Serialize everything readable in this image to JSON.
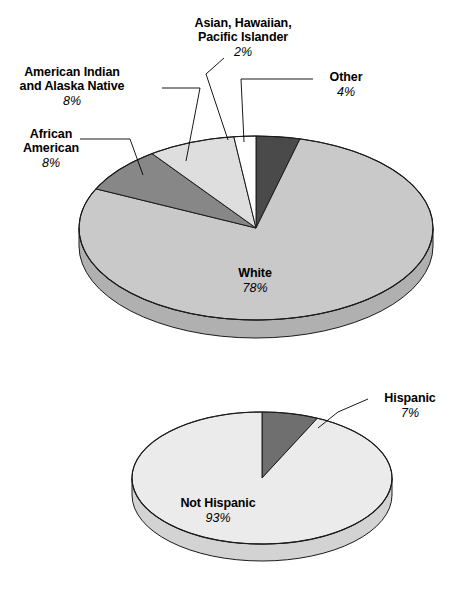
{
  "figure": {
    "background": "#ffffff",
    "width": 458,
    "height": 597
  },
  "chart_data": [
    {
      "type": "pie",
      "title": "",
      "chart_id": "race-pie",
      "three_d": true,
      "legend": "callout-labels",
      "categories": [
        "Other",
        "White",
        "African American",
        "American Indian and Alaska Native",
        "Asian, Hawaiian, Pacific Islander"
      ],
      "values": [
        4,
        78,
        8,
        8,
        2
      ],
      "slices": [
        {
          "label": "Other",
          "pct_text": "4%",
          "value": 4,
          "color": "#4a4a4a",
          "side_color": "#3a3a3a"
        },
        {
          "label": "White",
          "pct_text": "78%",
          "value": 78,
          "color": "#c9c9c9",
          "side_color": "#b0b0b0"
        },
        {
          "label": "African American",
          "pct_text": "8%",
          "value": 8,
          "color": "#878787",
          "side_color": "#6f6f6f"
        },
        {
          "label": "American Indian and Alaska Native",
          "pct_text": "8%",
          "value": 8,
          "color": "#dedede",
          "side_color": "#c2c2c2"
        },
        {
          "label": "Asian, Hawaiian, Pacific Islander",
          "pct_text": "2%",
          "value": 2,
          "color": "#ffffff",
          "side_color": "#e8e8e8"
        }
      ]
    },
    {
      "type": "pie",
      "title": "",
      "chart_id": "ethnicity-pie",
      "three_d": true,
      "legend": "callout-labels",
      "categories": [
        "Hispanic",
        "Not Hispanic"
      ],
      "values": [
        7,
        93
      ],
      "slices": [
        {
          "label": "Hispanic",
          "pct_text": "7%",
          "value": 7,
          "color": "#6f6f6f",
          "side_color": "#5c5c5c"
        },
        {
          "label": "Not Hispanic",
          "pct_text": "93%",
          "value": 93,
          "color": "#ebebeb",
          "side_color": "#d3d3d3"
        }
      ]
    }
  ],
  "labels": {
    "asian": {
      "line1": "Asian, Hawaiian,",
      "line2": "Pacific Islander",
      "pct": "2%"
    },
    "american_indian": {
      "line1": "American Indian",
      "line2": "and Alaska Native",
      "pct": "8%"
    },
    "african_american": {
      "line1": "African",
      "line2": "American",
      "pct": "8%"
    },
    "other": {
      "line1": "Other",
      "pct": "4%"
    },
    "white": {
      "line1": "White",
      "pct": "78%"
    },
    "hispanic": {
      "line1": "Hispanic",
      "pct": "7%"
    },
    "not_hispanic": {
      "line1": "Not Hispanic",
      "pct": "93%"
    }
  }
}
